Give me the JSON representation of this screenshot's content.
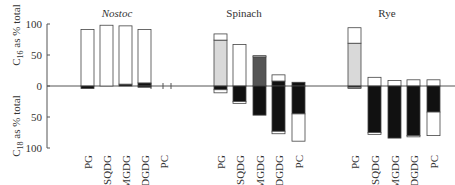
{
  "chart_data": {
    "type": "bar",
    "title": "",
    "ylabel_upper": "C16 as % total",
    "ylabel_lower": "C18 as % total",
    "y_ticks_upper": [
      100,
      50,
      0
    ],
    "y_ticks_lower": [
      50,
      100
    ],
    "ylim": [
      -100,
      100
    ],
    "grid": false,
    "legend": null,
    "colors": {
      "white": "#ffffff",
      "light_grey": "#d9d9d9",
      "dark_grey": "#555555",
      "black": "#111111",
      "outline": "#444444"
    },
    "panels": [
      {
        "title": "Nostoc",
        "italic": true,
        "categories": [
          "PG",
          "SQDG",
          "MGDG",
          "DGDG",
          "PC"
        ],
        "bars": [
          {
            "category": "PG",
            "up": [
              {
                "to": 91,
                "fill": "white"
              }
            ],
            "down": [
              {
                "to": 4,
                "fill": "black"
              }
            ]
          },
          {
            "category": "SQDG",
            "up": [
              {
                "to": 98,
                "fill": "white"
              }
            ],
            "down": []
          },
          {
            "category": "MGDG",
            "up": [
              {
                "to": 3,
                "fill": "black"
              },
              {
                "to": 97,
                "fill": "white"
              }
            ],
            "down": []
          },
          {
            "category": "DGDG",
            "up": [
              {
                "to": 5,
                "fill": "black"
              },
              {
                "to": 91,
                "fill": "white"
              }
            ],
            "down": [
              {
                "to": 2,
                "fill": "black"
              }
            ]
          },
          {
            "category": "PC",
            "up": [],
            "down": []
          }
        ]
      },
      {
        "title": "Spinach",
        "italic": false,
        "categories": [
          "PG",
          "SQDG",
          "MGDG",
          "DGDG",
          "PC"
        ],
        "bars": [
          {
            "category": "PG",
            "up": [
              {
                "to": 74,
                "fill": "light_grey"
              },
              {
                "to": 84,
                "fill": "white"
              }
            ],
            "down": [
              {
                "to": 6,
                "fill": "black"
              },
              {
                "to": 11,
                "fill": "white"
              }
            ]
          },
          {
            "category": "SQDG",
            "up": [
              {
                "to": 67,
                "fill": "white"
              }
            ],
            "down": [
              {
                "to": 25,
                "fill": "black"
              },
              {
                "to": 28,
                "fill": "white"
              }
            ]
          },
          {
            "category": "MGDG",
            "up": [
              {
                "to": 47,
                "fill": "dark_grey"
              },
              {
                "to": 49,
                "fill": "white"
              }
            ],
            "down": [
              {
                "to": 47,
                "fill": "black"
              }
            ]
          },
          {
            "category": "DGDG",
            "up": [
              {
                "to": 8,
                "fill": "black"
              },
              {
                "to": 18,
                "fill": "white"
              }
            ],
            "down": [
              {
                "to": 73,
                "fill": "black"
              },
              {
                "to": 77,
                "fill": "white"
              }
            ]
          },
          {
            "category": "PC",
            "up": [
              {
                "to": 6,
                "fill": "black"
              }
            ],
            "down": [
              {
                "to": 45,
                "fill": "black"
              },
              {
                "to": 89,
                "fill": "white"
              }
            ]
          }
        ]
      },
      {
        "title": "Rye",
        "italic": false,
        "categories": [
          "PG",
          "SQDG",
          "MGDG",
          "DGDG",
          "PC"
        ],
        "bars": [
          {
            "category": "PG",
            "up": [
              {
                "to": 69,
                "fill": "light_grey"
              },
              {
                "to": 94,
                "fill": "white"
              }
            ],
            "down": [
              {
                "to": 2,
                "fill": "black"
              },
              {
                "to": 4,
                "fill": "white"
              }
            ]
          },
          {
            "category": "SQDG",
            "up": [
              {
                "to": 14,
                "fill": "white"
              }
            ],
            "down": [
              {
                "to": 75,
                "fill": "black"
              },
              {
                "to": 78,
                "fill": "white"
              }
            ]
          },
          {
            "category": "MGDG",
            "up": [
              {
                "to": 9,
                "fill": "white"
              }
            ],
            "down": [
              {
                "to": 84,
                "fill": "black"
              }
            ]
          },
          {
            "category": "DGDG",
            "up": [
              {
                "to": 10,
                "fill": "white"
              }
            ],
            "down": [
              {
                "to": 80,
                "fill": "black"
              },
              {
                "to": 82,
                "fill": "white"
              }
            ]
          },
          {
            "category": "PC",
            "up": [
              {
                "to": 10,
                "fill": "white"
              }
            ],
            "down": [
              {
                "to": 42,
                "fill": "black"
              },
              {
                "to": 80,
                "fill": "white"
              }
            ]
          }
        ]
      }
    ]
  },
  "layout": {
    "zero_y": 86,
    "px_per_pct": 0.62,
    "axis_x": 47,
    "bar_width": 13,
    "panel_bar_x": [
      [
        81,
        100,
        119,
        138,
        157
      ],
      [
        214,
        233,
        253,
        272,
        292
      ],
      [
        348,
        368,
        388,
        407,
        427
      ]
    ],
    "panel_title_x": [
      117,
      244,
      387
    ],
    "tick_marks_x": [
      151,
      163,
      171
    ]
  }
}
